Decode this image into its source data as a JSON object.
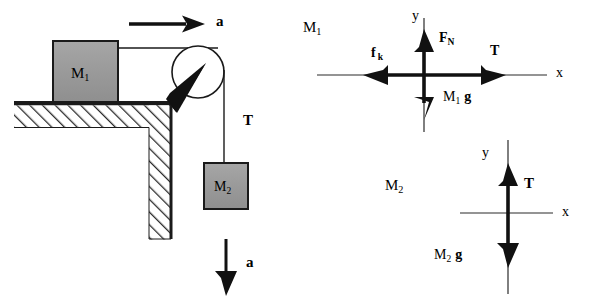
{
  "figure": {
    "background": "#ffffff",
    "ink": "#1a1a1a",
    "block_fill": "#9a9a9a",
    "hatch_color": "#2b2b2b"
  },
  "system_diagram": {
    "name": "pulley-system-sketch",
    "block_m1": {
      "label_main": "M",
      "label_sub": "1"
    },
    "block_m2": {
      "label_main": "M",
      "label_sub": "2"
    },
    "tension_label": "T",
    "accel_top_label": "a",
    "accel_bottom_label": "a",
    "parts": [
      "block-m1",
      "hatched-table",
      "hatched-wall",
      "pulley-wheel",
      "pulley-bracket",
      "rope-horizontal",
      "rope-vertical",
      "block-m2",
      "arrow-a-top",
      "arrow-a-bottom"
    ]
  },
  "fbd_m1": {
    "name": "free-body-diagram-m1",
    "body_label_main": "M",
    "body_label_sub": "1",
    "axis_y_label": "y",
    "axis_x_label": "x",
    "forces": [
      {
        "name": "normal-force",
        "label_main": "F",
        "label_sub": "N",
        "direction": "up"
      },
      {
        "name": "tension-force",
        "label_main": "T",
        "label_sub": "",
        "direction": "right"
      },
      {
        "name": "kinetic-friction",
        "label_main": "f",
        "label_sub": "k",
        "direction": "left"
      },
      {
        "name": "weight-force",
        "label_main": "M",
        "label_sub": "1",
        "label_tail": "g",
        "direction": "down"
      }
    ]
  },
  "fbd_m2": {
    "name": "free-body-diagram-m2",
    "body_label_main": "M",
    "body_label_sub": "2",
    "axis_y_label": "y",
    "axis_x_label": "x",
    "forces": [
      {
        "name": "tension-force",
        "label_main": "T",
        "label_sub": "",
        "direction": "up"
      },
      {
        "name": "weight-force",
        "label_main": "M",
        "label_sub": "2",
        "label_tail": "g",
        "direction": "down"
      }
    ]
  }
}
